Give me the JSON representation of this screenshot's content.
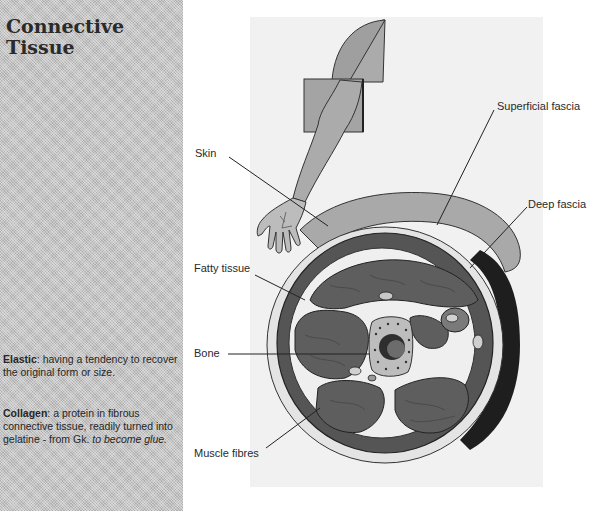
{
  "sidebar": {
    "title_line1": "Connective",
    "title_line2": "Tissue",
    "glossary": [
      {
        "term": "Elastic",
        "definition": ": having a tendency to recover the original form or size."
      },
      {
        "term": "Collagen",
        "definition": ": a protein in fibrous connective tissue, readily turned into gelatine - from Gk.",
        "etymology": "to become glue."
      }
    ]
  },
  "figure": {
    "labels": {
      "skin": "Skin",
      "superficial_fascia": "Superficial fascia",
      "deep_fascia": "Deep fascia",
      "fatty_tissue": "Fatty tissue",
      "bone": "Bone",
      "muscle_fibres": "Muscle fibres"
    },
    "colors": {
      "sidebar_bg": "#c4c4c4",
      "figure_bg": "#f1f1f1",
      "skin_layer": "#a9a9a9",
      "muscle": "#5e5e5e",
      "fascia": "#e8e8e8",
      "dark_edge": "#1e1e1e",
      "bone": "#bdbdbd",
      "marrow": "#3a3a3a"
    }
  }
}
